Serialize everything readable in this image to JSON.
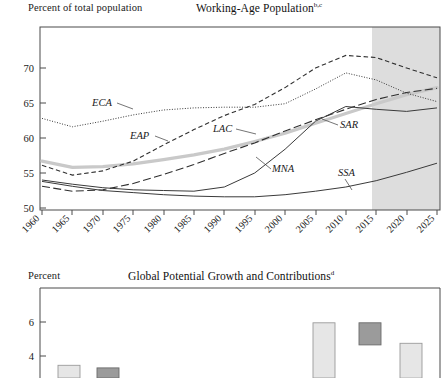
{
  "figure": {
    "background": "#ffffff",
    "ink": "#1a1a1a"
  },
  "top_panel": {
    "unit_label": "Percent of total population",
    "title": "Working-Age Population",
    "title_superscript": "b,c",
    "series_labels": {
      "eca": "ECA",
      "eap": "EAP",
      "lac": "LAC",
      "sar": "SAR",
      "mna": "MNA",
      "ssa": "SSA"
    }
  },
  "bottom_panel": {
    "unit_label": "Percent",
    "title": "Global Potential Growth and Contributions",
    "title_superscript": "d"
  },
  "chart_data": [
    {
      "type": "line",
      "title": "Working-Age Population",
      "title_superscript": "b,c",
      "xlabel": "",
      "ylabel": "Percent of total population",
      "xlim": [
        1960,
        2026
      ],
      "ylim": [
        50,
        73
      ],
      "yticks": [
        50,
        55,
        60,
        65,
        70
      ],
      "xticks": [
        1960,
        1965,
        1970,
        1975,
        1980,
        1985,
        1990,
        1995,
        2000,
        2005,
        2010,
        2015,
        2020,
        2025
      ],
      "xtick_labels": [
        "1960",
        "1965",
        "1970",
        "1975",
        "1980",
        "1985",
        "1990",
        "1995",
        "2000",
        "2005",
        "2010",
        "2015",
        "2020",
        "2025"
      ],
      "grid": false,
      "legend_position": "inline-annotations",
      "shaded_forecast_region": {
        "from": 2017,
        "to": 2026,
        "color": "#dddddd",
        "meaning": "projection"
      },
      "x": [
        1960,
        1965,
        1970,
        1975,
        1980,
        1985,
        1990,
        1995,
        2000,
        2005,
        2010,
        2015,
        2020,
        2025
      ],
      "series": [
        {
          "name": "ECA",
          "style": "dotted",
          "color": "#3a3a3a",
          "label_anchor_year": 1970,
          "values": [
            62.8,
            61.6,
            62.4,
            63.3,
            64.0,
            64.3,
            64.4,
            64.4,
            64.9,
            67.0,
            69.3,
            68.3,
            66.4,
            65.2
          ]
        },
        {
          "name": "EAP",
          "style": "short-dash",
          "color": "#2e2e2e",
          "label_anchor_year": 1982,
          "values": [
            56.1,
            54.7,
            55.3,
            56.7,
            59.0,
            61.2,
            63.2,
            64.8,
            67.2,
            70.0,
            71.8,
            71.5,
            70.0,
            68.6
          ]
        },
        {
          "name": "LAC",
          "style": "long-dash",
          "color": "#2e2e2e",
          "label_anchor_year": 1995,
          "values": [
            53.1,
            52.4,
            52.6,
            53.5,
            54.8,
            56.2,
            57.8,
            59.3,
            61.0,
            62.6,
            64.1,
            65.5,
            66.5,
            67.1
          ]
        },
        {
          "name": "SAR",
          "style": "thick-gray",
          "color": "#c9c9c9",
          "label_anchor_year": 2012,
          "values": [
            56.7,
            55.8,
            55.9,
            56.3,
            56.9,
            57.6,
            58.4,
            59.5,
            60.7,
            62.1,
            63.5,
            64.9,
            66.2,
            67.2
          ]
        },
        {
          "name": "MNA",
          "style": "solid-thin",
          "color": "#3a3a3a",
          "label_anchor_year": 2000,
          "values": [
            54.0,
            53.4,
            52.9,
            52.6,
            52.5,
            52.4,
            53.0,
            55.0,
            58.4,
            62.4,
            64.5,
            64.1,
            63.8,
            64.3
          ]
        },
        {
          "name": "SSA",
          "style": "solid-thin",
          "color": "#3a3a3a",
          "label_anchor_year": 2008,
          "values": [
            53.8,
            53.1,
            52.5,
            52.2,
            51.9,
            51.7,
            51.6,
            51.6,
            51.9,
            52.4,
            53.0,
            53.9,
            55.1,
            56.4
          ]
        }
      ]
    },
    {
      "type": "bar",
      "title": "Global Potential Growth and Contributions",
      "title_superscript": "d",
      "xlabel": "",
      "ylabel": "Percent",
      "ylim": [
        0,
        7.4
      ],
      "yticks": [
        4,
        6
      ],
      "ytick_labels": [
        "4",
        "6"
      ],
      "grid": false,
      "note": "lower portion of panel is cropped by the screenshot edge",
      "categories": [
        "b1",
        "b2",
        "b3",
        "b4",
        "b5",
        "b6",
        "b7",
        "b8",
        "b9"
      ],
      "values": [
        3.45,
        3.3,
        2.6,
        null,
        null,
        5.95,
        5.95,
        4.75,
        null
      ],
      "bar_fills": [
        "light",
        "dark",
        "dark",
        null,
        null,
        "light",
        "dark",
        "light",
        null
      ],
      "bar_segments": [
        {
          "category": "b1",
          "fill": "light",
          "top": 3.45
        },
        {
          "category": "b2",
          "fill": "dark",
          "top": 3.3
        },
        {
          "category": "b3",
          "fill": "dark",
          "top": 2.6
        },
        {
          "category": "b6",
          "fill": "light",
          "top": 5.95
        },
        {
          "category": "b7",
          "fill": "dark",
          "top": 5.95,
          "bottom": 4.65
        },
        {
          "category": "b8",
          "fill": "light",
          "top": 4.75
        }
      ],
      "colors": {
        "light": "#e6e6e6",
        "dark": "#9b9b9b",
        "edge": "#8a8a8a"
      }
    }
  ]
}
